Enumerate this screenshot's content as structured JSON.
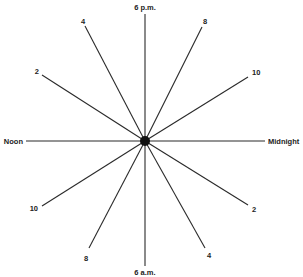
{
  "diagram": {
    "type": "radial-clock-diagram",
    "center": {
      "x": 145,
      "y": 141,
      "radius": 5
    },
    "colors": {
      "line": "#2a2a2a",
      "hub": "#111111",
      "text": "#222222",
      "background": "#ffffff"
    },
    "spokes": [
      {
        "id": "6pm",
        "label": "6 p.m.",
        "x2": 145,
        "y2": 14,
        "lx": 145,
        "ly": 10,
        "anchor": "middle"
      },
      {
        "id": "8pm",
        "label": "8",
        "x2": 202,
        "y2": 27,
        "lx": 205,
        "ly": 24,
        "anchor": "middle"
      },
      {
        "id": "10pm",
        "label": "10",
        "x2": 248,
        "y2": 77,
        "lx": 252,
        "ly": 75,
        "anchor": "start"
      },
      {
        "id": "midnight",
        "label": "Midnight",
        "x2": 265,
        "y2": 141,
        "lx": 268,
        "ly": 144,
        "anchor": "start"
      },
      {
        "id": "2am",
        "label": "2",
        "x2": 248,
        "y2": 205,
        "lx": 252,
        "ly": 212,
        "anchor": "start"
      },
      {
        "id": "4am",
        "label": "4",
        "x2": 205,
        "y2": 248,
        "lx": 209,
        "ly": 258,
        "anchor": "middle"
      },
      {
        "id": "6am",
        "label": "6 a.m.",
        "x2": 145,
        "y2": 266,
        "lx": 145,
        "ly": 275,
        "anchor": "middle"
      },
      {
        "id": "8am",
        "label": "8",
        "x2": 89,
        "y2": 248,
        "lx": 86,
        "ly": 261,
        "anchor": "middle"
      },
      {
        "id": "10am",
        "label": "10",
        "x2": 42,
        "y2": 206,
        "lx": 38,
        "ly": 211,
        "anchor": "end"
      },
      {
        "id": "noon",
        "label": "Noon",
        "x2": 26,
        "y2": 141,
        "lx": 23,
        "ly": 144,
        "anchor": "end"
      },
      {
        "id": "2pm",
        "label": "2",
        "x2": 42,
        "y2": 75,
        "lx": 39,
        "ly": 74,
        "anchor": "end"
      },
      {
        "id": "4pm",
        "label": "4",
        "x2": 85,
        "y2": 26,
        "lx": 83,
        "ly": 24,
        "anchor": "middle"
      }
    ]
  }
}
